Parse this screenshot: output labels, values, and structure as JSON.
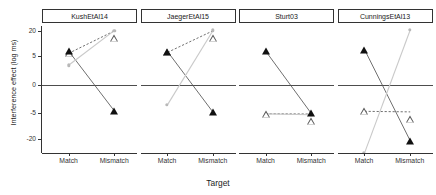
{
  "chart_data": {
    "type": "line",
    "title": "",
    "xlabel": "Target",
    "ylabel": "Interference effect (log ms)",
    "categories": [
      "Match",
      "Mismatch"
    ],
    "ytick_labels": [
      "20",
      "5",
      "0",
      "-5",
      "-20"
    ],
    "ytick_values": [
      20,
      5,
      0,
      -5,
      -20
    ],
    "ylim": [
      -30,
      24
    ],
    "grid": false,
    "legend": "none",
    "zero_reference_line": 0,
    "facets": [
      {
        "label": "KushEtAl14",
        "series": [
          {
            "name": "filled-triangle",
            "marker": "triangle-filled",
            "color": "#111111",
            "linestyle": "solid",
            "values": [
              8.0,
              -4.6
            ]
          },
          {
            "name": "open-triangle",
            "marker": "triangle-open",
            "color": "#555555",
            "linestyle": "dashed",
            "values": [
              6.6,
              20.0
            ]
          },
          {
            "name": "gray-point",
            "marker": "circle",
            "color": "#b8b8b8",
            "linestyle": "solid",
            "values": [
              3.4,
              20.2
            ]
          }
        ]
      },
      {
        "label": "JaegerEtAl15",
        "series": [
          {
            "name": "filled-triangle",
            "marker": "triangle-filled",
            "color": "#111111",
            "linestyle": "solid",
            "values": [
              7.6,
              -4.9
            ]
          },
          {
            "name": "open-triangle",
            "marker": "triangle-open",
            "color": "#555555",
            "linestyle": "dashed",
            "values": [
              7.2,
              20.2
            ]
          },
          {
            "name": "gray-point",
            "marker": "circle",
            "color": "#b8b8b8",
            "linestyle": "solid",
            "values": [
              -3.5,
              20.4
            ]
          }
        ]
      },
      {
        "label": "Sturt03",
        "series": [
          {
            "name": "filled-triangle",
            "marker": "triangle-filled",
            "color": "#111111",
            "linestyle": "solid",
            "values": [
              8.0,
              -5.2
            ]
          },
          {
            "name": "open-triangle",
            "marker": "triangle-open",
            "color": "#555555",
            "linestyle": "dashed",
            "values": [
              -5.4,
              -5.6
            ]
          },
          {
            "name": "gray-point",
            "marker": "circle",
            "color": "#b8b8b8",
            "linestyle": "solid",
            "values": [
              -5.5,
              -6.0
            ]
          }
        ]
      },
      {
        "label": "CunningsEtAl13",
        "series": [
          {
            "name": "filled-triangle",
            "marker": "triangle-filled",
            "color": "#111111",
            "linestyle": "solid",
            "values": [
              8.8,
              -21.0
            ]
          },
          {
            "name": "open-triangle",
            "marker": "triangle-open",
            "color": "#555555",
            "linestyle": "dashed",
            "values": [
              -4.7,
              -4.8
            ]
          },
          {
            "name": "gray-point",
            "marker": "circle",
            "color": "#b8b8b8",
            "linestyle": "solid",
            "values": [
              -28.0,
              20.6
            ]
          }
        ]
      }
    ]
  },
  "axes": {
    "y_title": "Interference effect (log ms)",
    "x_title": "Target"
  },
  "colors": {
    "filled": "#111111",
    "open": "#555555",
    "gray": "#b8b8b8",
    "axis": "#333333",
    "zero_line": "#4d4d4d"
  }
}
